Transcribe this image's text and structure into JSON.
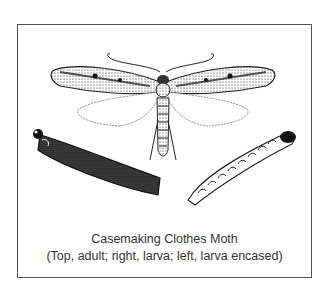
{
  "figure": {
    "caption_title": "Casemaking Clothes Moth",
    "caption_detail": "(Top, adult; right, larva; left, larva encased)",
    "illustrations": [
      {
        "name": "adult-moth",
        "position": "top"
      },
      {
        "name": "larva",
        "position": "right"
      },
      {
        "name": "larva-encased",
        "position": "left"
      }
    ]
  },
  "colors": {
    "ink": "#1a1a1a",
    "frame": "#555555",
    "background": "#ffffff"
  }
}
